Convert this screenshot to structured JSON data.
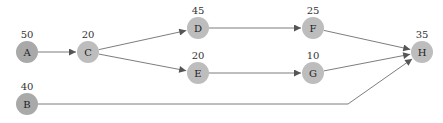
{
  "diagram": {
    "type": "directed-graph",
    "colors": {
      "source_node": "#a9a9a9",
      "node": "#bdbdbd",
      "edge": "#6e6e6e",
      "text": "#222222"
    },
    "nodes": [
      {
        "id": "A",
        "label": "A",
        "weight": "50",
        "x": 27,
        "y": 52,
        "kind": "source"
      },
      {
        "id": "B",
        "label": "B",
        "weight": "40",
        "x": 27,
        "y": 104,
        "kind": "source"
      },
      {
        "id": "C",
        "label": "C",
        "weight": "20",
        "x": 88,
        "y": 52,
        "kind": "normal"
      },
      {
        "id": "D",
        "label": "D",
        "weight": "45",
        "x": 198,
        "y": 28,
        "kind": "normal"
      },
      {
        "id": "E",
        "label": "E",
        "weight": "20",
        "x": 198,
        "y": 73,
        "kind": "normal"
      },
      {
        "id": "F",
        "label": "F",
        "weight": "25",
        "x": 313,
        "y": 28,
        "kind": "normal"
      },
      {
        "id": "G",
        "label": "G",
        "weight": "10",
        "x": 313,
        "y": 73,
        "kind": "normal"
      },
      {
        "id": "H",
        "label": "H",
        "weight": "35",
        "x": 422,
        "y": 52,
        "kind": "normal"
      }
    ],
    "edges": [
      {
        "from": "A",
        "to": "C"
      },
      {
        "from": "C",
        "to": "D"
      },
      {
        "from": "C",
        "to": "E"
      },
      {
        "from": "D",
        "to": "F"
      },
      {
        "from": "E",
        "to": "G"
      },
      {
        "from": "F",
        "to": "H"
      },
      {
        "from": "G",
        "to": "H"
      },
      {
        "from": "B",
        "to": "H",
        "via": [
          [
            348,
            104
          ]
        ]
      }
    ]
  }
}
